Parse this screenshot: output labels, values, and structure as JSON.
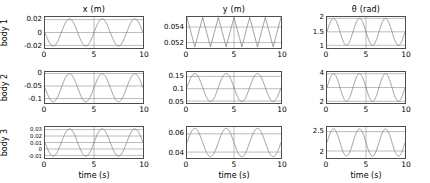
{
  "figure": {
    "row_labels": [
      "body 1",
      "body 2",
      "body 3"
    ],
    "col_titles": [
      "x (m)",
      "y (m)",
      "θ (rad)"
    ],
    "xlabel": "time (s)",
    "x_ticks": [
      "0",
      "5",
      "10"
    ],
    "line_color": "#7f7f7f",
    "axis_color": "#4d4d4d",
    "grid_color": "#8c8c8c"
  },
  "chart_data": [
    {
      "type": "line",
      "title": "x (m)",
      "row": "body 1",
      "xlabel": "time (s)",
      "ylabel": "x (m)",
      "xlim": [
        0,
        10
      ],
      "ylim": [
        -0.024,
        0.024
      ],
      "x_ticks": [
        0,
        5,
        10
      ],
      "y_ticks": [
        -0.02,
        0,
        0.02
      ],
      "y_tick_labels": [
        "-0.02",
        "0",
        "0.02"
      ],
      "grid": true,
      "legend": "none",
      "series": [
        {
          "name": "x body 1",
          "amplitude": 0.021,
          "offset": 0.0,
          "cycles": 3,
          "phase_deg": 180,
          "waveform": "sine"
        }
      ]
    },
    {
      "type": "line",
      "title": "y (m)",
      "row": "body 1",
      "xlabel": "time (s)",
      "ylabel": "y (m)",
      "xlim": [
        0,
        10
      ],
      "ylim": [
        0.0513,
        0.0553
      ],
      "x_ticks": [
        0,
        5,
        10
      ],
      "y_ticks": [
        0.052,
        0.054
      ],
      "y_tick_labels": [
        "0.052",
        "0.054"
      ],
      "grid": true,
      "legend": "none",
      "series": [
        {
          "name": "y body 1",
          "amplitude": 0.0019,
          "offset": 0.05335,
          "cycles": 6,
          "phase_deg": 180,
          "waveform": "triangle"
        }
      ]
    },
    {
      "type": "line",
      "title": "θ (rad)",
      "row": "body 1",
      "xlabel": "time (s)",
      "ylabel": "θ (rad)",
      "xlim": [
        0,
        10
      ],
      "ylim": [
        0.9,
        2.05
      ],
      "x_ticks": [
        0,
        5,
        10
      ],
      "y_ticks": [
        1,
        1.5,
        2
      ],
      "y_tick_labels": [
        "1",
        "1.5",
        "2"
      ],
      "grid": true,
      "legend": "none",
      "series": [
        {
          "name": "theta body 1",
          "amplitude": 0.5,
          "offset": 1.5,
          "cycles": 3,
          "phase_deg": 0,
          "waveform": "sine"
        }
      ]
    },
    {
      "type": "line",
      "title": "x (m)",
      "row": "body 2",
      "xlabel": "time (s)",
      "ylabel": "x (m)",
      "xlim": [
        0,
        10
      ],
      "ylim": [
        -0.118,
        0.006
      ],
      "x_ticks": [
        0,
        5,
        10
      ],
      "y_ticks": [
        -0.1,
        -0.05,
        0
      ],
      "y_tick_labels": [
        "-0.1",
        "-0.05",
        "0"
      ],
      "grid": true,
      "legend": "none",
      "series": [
        {
          "name": "x body 2",
          "amplitude": 0.056,
          "offset": -0.057,
          "cycles": 3,
          "phase_deg": 180,
          "waveform": "sine"
        }
      ]
    },
    {
      "type": "line",
      "title": "y (m)",
      "row": "body 2",
      "xlabel": "time (s)",
      "ylabel": "y (m)",
      "xlim": [
        0,
        10
      ],
      "ylim": [
        0.042,
        0.168
      ],
      "x_ticks": [
        0,
        5,
        10
      ],
      "y_ticks": [
        0.05,
        0.1,
        0.15
      ],
      "y_tick_labels": [
        "0.05",
        "0.1",
        "0.15"
      ],
      "grid": true,
      "legend": "none",
      "series": [
        {
          "name": "y body 2",
          "amplitude": 0.057,
          "offset": 0.105,
          "cycles": 3,
          "phase_deg": 0,
          "waveform": "sine"
        }
      ]
    },
    {
      "type": "line",
      "title": "θ (rad)",
      "row": "body 2",
      "xlabel": "time (s)",
      "ylabel": "θ (rad)",
      "xlim": [
        0,
        10
      ],
      "ylim": [
        1.88,
        4.12
      ],
      "x_ticks": [
        0,
        5,
        10
      ],
      "y_ticks": [
        2,
        3,
        4
      ],
      "y_tick_labels": [
        "2",
        "3",
        "4"
      ],
      "grid": true,
      "legend": "none",
      "series": [
        {
          "name": "theta body 2",
          "amplitude": 1.0,
          "offset": 3.0,
          "cycles": 3,
          "phase_deg": 0,
          "waveform": "sine"
        }
      ]
    },
    {
      "type": "line",
      "title": "x (m)",
      "row": "body 3",
      "xlabel": "time (s)",
      "ylabel": "x (m)",
      "xlim": [
        0,
        10
      ],
      "ylim": [
        -0.014,
        0.034
      ],
      "x_ticks": [
        0,
        5,
        10
      ],
      "y_ticks": [
        -0.01,
        0,
        0.01,
        0.02,
        0.03
      ],
      "y_tick_labels": [
        "-0.01",
        "0",
        "0.01",
        "0.02",
        "0.03"
      ],
      "grid": true,
      "legend": "none",
      "series": [
        {
          "name": "x body 3",
          "amplitude": 0.021,
          "offset": 0.01,
          "cycles": 3,
          "phase_deg": 180,
          "waveform": "sine"
        }
      ]
    },
    {
      "type": "line",
      "title": "y (m)",
      "row": "body 3",
      "xlabel": "time (s)",
      "ylabel": "y (m)",
      "xlim": [
        0,
        10
      ],
      "ylim": [
        0.0335,
        0.0675
      ],
      "x_ticks": [
        0,
        5,
        10
      ],
      "y_ticks": [
        0.04,
        0.06
      ],
      "y_tick_labels": [
        "0.04",
        "0.06"
      ],
      "grid": true,
      "legend": "none",
      "series": [
        {
          "name": "y body 3",
          "amplitude": 0.0155,
          "offset": 0.0505,
          "cycles": 3,
          "phase_deg": 0,
          "waveform": "sine"
        }
      ]
    },
    {
      "type": "line",
      "title": "θ (rad)",
      "row": "body 3",
      "xlabel": "time (s)",
      "ylabel": "θ (rad)",
      "xlim": [
        0,
        10
      ],
      "ylim": [
        1.82,
        2.62
      ],
      "x_ticks": [
        0,
        5,
        10
      ],
      "y_ticks": [
        2,
        2.5
      ],
      "y_tick_labels": [
        "2",
        "2.5"
      ],
      "grid": true,
      "legend": "none",
      "series": [
        {
          "name": "theta body 3",
          "amplitude": 0.35,
          "offset": 2.22,
          "cycles": 3,
          "phase_deg": 0,
          "waveform": "sine"
        }
      ]
    }
  ]
}
